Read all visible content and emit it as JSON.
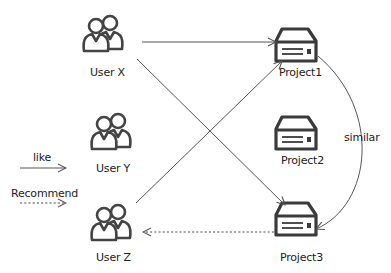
{
  "users": [
    {
      "id": "user-x",
      "label": "User X"
    },
    {
      "id": "user-y",
      "label": "User Y"
    },
    {
      "id": "user-z",
      "label": "User Z"
    }
  ],
  "projects": [
    {
      "id": "project1",
      "label": "Project1"
    },
    {
      "id": "project2",
      "label": "Project2"
    },
    {
      "id": "project3",
      "label": "Project3"
    }
  ],
  "edges": [
    {
      "from": "User X",
      "to": "Project1",
      "type": "like"
    },
    {
      "from": "User X",
      "to": "Project3",
      "type": "like"
    },
    {
      "from": "User Z",
      "to": "Project1",
      "type": "like"
    },
    {
      "from": "Project3",
      "to": "User Z",
      "type": "recommend"
    },
    {
      "from": "Project1",
      "to": "Project3",
      "type": "similar"
    }
  ],
  "similar_label": "similar",
  "legend": {
    "like": "like",
    "recommend": "Recommend"
  },
  "colors": {
    "stroke": "#444444",
    "line": "#555555"
  }
}
